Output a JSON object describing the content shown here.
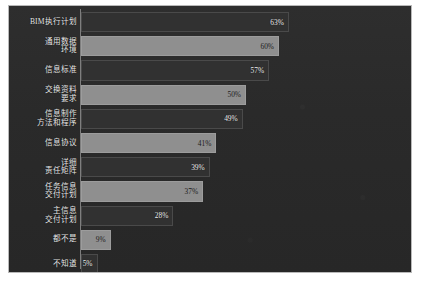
{
  "chart_data": {
    "type": "bar",
    "orientation": "horizontal",
    "title": "",
    "subtitle": "",
    "xlabel": "",
    "ylabel": "",
    "xlim": [
      0,
      100
    ],
    "grid": false,
    "legend": null,
    "value_suffix": "%",
    "categories": [
      "BIM执行计划",
      "通用数据\n环境",
      "信息标准",
      "交换资料\n要求",
      "信息制作\n方法和程序",
      "信息协议",
      "详细\n责任矩阵",
      "任务信息\n交付计划",
      "主信息\n交付计划",
      "都不是",
      "不知道"
    ],
    "values": [
      63,
      60,
      57,
      50,
      49,
      41,
      39,
      37,
      28,
      9,
      5
    ],
    "value_labels": [
      "63%",
      "60%",
      "57%",
      "50%",
      "49%",
      "41%",
      "39%",
      "37%",
      "28%",
      "9%",
      "5%"
    ],
    "bar_styles": [
      "dark",
      "light",
      "dark",
      "light",
      "dark",
      "light",
      "dark",
      "light",
      "dark",
      "light",
      "dark"
    ],
    "colors": {
      "background": "#2b2b2b",
      "plot_background": "#2a2a2a",
      "bar_dark": "#313131",
      "bar_light": "#8f8f8f",
      "axis": "#7e7e7e",
      "label_text": "#e9e9e9",
      "frame": "#b9b9b9",
      "page": "#ffffff"
    }
  }
}
